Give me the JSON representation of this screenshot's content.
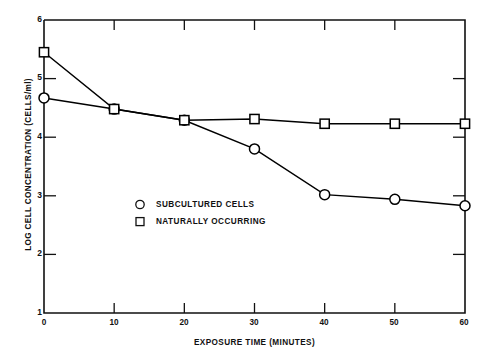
{
  "chart_data": {
    "type": "line",
    "title": "",
    "subtitle": "",
    "xlabel": "EXPOSURE TIME (MINUTES)",
    "ylabel": "LOG CELL CONCENTRATION (CELLS/ml)",
    "xlim": [
      0,
      60
    ],
    "ylim": [
      1,
      6
    ],
    "xticks": [
      0,
      10,
      20,
      30,
      40,
      50,
      60
    ],
    "yticks": [
      1,
      2,
      3,
      4,
      5,
      6
    ],
    "xtick_labels": [
      "0",
      "10",
      "20",
      "30",
      "40",
      "50",
      "60"
    ],
    "ytick_labels": [
      "1",
      "2",
      "3",
      "4",
      "5",
      "6"
    ],
    "grid": false,
    "legend_position": "center-left-inside",
    "x": [
      0,
      10,
      20,
      30,
      40,
      50,
      60
    ],
    "series": [
      {
        "name": "SUBCULTURED CELLS",
        "marker": "circle",
        "color": "#000000",
        "values": [
          4.67,
          4.48,
          4.29,
          3.8,
          3.02,
          2.94,
          2.83
        ]
      },
      {
        "name": "NATURALLY OCCURRING",
        "marker": "square",
        "color": "#000000",
        "values": [
          5.45,
          4.48,
          4.29,
          4.31,
          4.23,
          4.23,
          4.23
        ]
      }
    ]
  },
  "legend": {
    "items": [
      {
        "label": "SUBCULTURED CELLS",
        "marker": "circle"
      },
      {
        "label": "NATURALLY OCCURRING",
        "marker": "square"
      }
    ]
  },
  "axes": {
    "x_title": "EXPOSURE TIME (MINUTES)",
    "y_title": "LOG CELL CONCENTRATION (CELLS/ml)",
    "y_labels": [
      "6",
      "5",
      "4",
      "3",
      "2",
      "1"
    ],
    "x_labels": [
      "0",
      "10",
      "20",
      "30",
      "40",
      "50",
      "60"
    ]
  }
}
